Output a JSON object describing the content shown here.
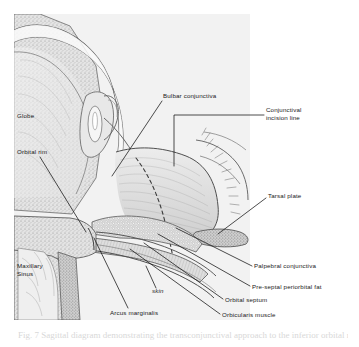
{
  "figure": {
    "panel": {
      "background_color": "#f2f2f2",
      "ink_color": "#3a3a3a",
      "leader_line_color": "#111111"
    },
    "caption": "Fig. 7  Sagittal diagram demonstrating the transconjunctival approach to the inferior orbital rim",
    "labels": [
      {
        "id": "globe",
        "text": "Globe",
        "x": 17,
        "y": 116,
        "has_leader": false
      },
      {
        "id": "orbital-rim",
        "text": "Orbital rim",
        "x": 17,
        "y": 152,
        "has_leader": true
      },
      {
        "id": "maxillary-sinus",
        "text": "Maxillary\nSinus",
        "line1": "Maxillary",
        "line2": "Sinus",
        "x": 17,
        "y": 266,
        "has_leader": false
      },
      {
        "id": "bulbar-conjunctiva",
        "text": "Bulbar conjunctiva",
        "x": 163,
        "y": 96,
        "has_leader": true
      },
      {
        "id": "conjunctival-incision-line",
        "text": "Conjunctival\nincision line",
        "line1": "Conjunctival",
        "line2": "incision line",
        "x": 266,
        "y": 110,
        "has_leader": true
      },
      {
        "id": "tarsal-plate",
        "text": "Tarsal plate",
        "x": 268,
        "y": 196,
        "has_leader": true
      },
      {
        "id": "palpebral-conjunctiva",
        "text": "Palpebral conjunctiva",
        "x": 254,
        "y": 267,
        "has_leader": true
      },
      {
        "id": "pre-septal-periorbital-fat",
        "text": "Pre-septal periorbital fat",
        "x": 252,
        "y": 288,
        "has_leader": true
      },
      {
        "id": "orbital-septum",
        "text": "Orbital septum",
        "x": 225,
        "y": 301,
        "has_leader": true
      },
      {
        "id": "orbicularis-muscle",
        "text": "Orbicularis muscle",
        "x": 222,
        "y": 316,
        "has_leader": true
      },
      {
        "id": "skin",
        "text": "skin",
        "x": 152,
        "y": 291,
        "italic": true,
        "has_leader": true
      },
      {
        "id": "arcus-marginalis",
        "text": "Arcus marginalis",
        "x": 110,
        "y": 313,
        "has_leader": true
      }
    ]
  }
}
